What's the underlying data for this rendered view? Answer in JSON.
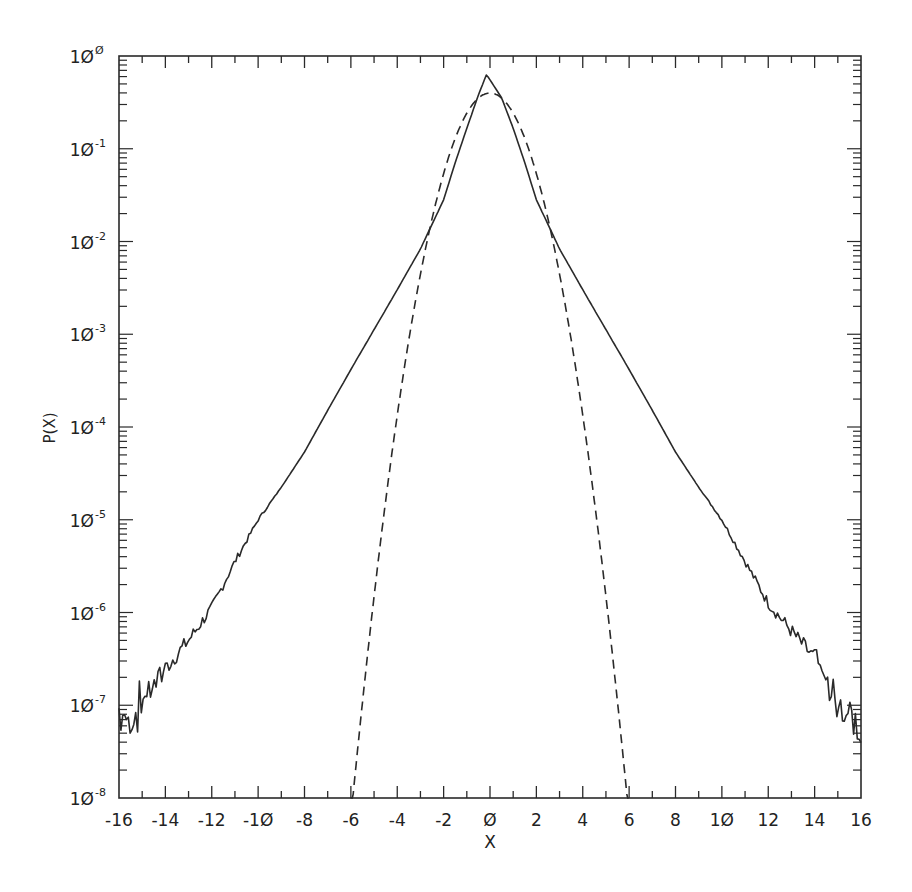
{
  "chart_data": {
    "type": "line",
    "title": "",
    "xlabel": "X",
    "ylabel": "P(X)",
    "xlim": [
      -16,
      16
    ],
    "ylim": [
      1e-08,
      1
    ],
    "yscale": "log",
    "grid": false,
    "legend": null,
    "x_ticks": [
      -16,
      -14,
      -12,
      -10,
      -8,
      -6,
      -4,
      -2,
      0,
      2,
      4,
      6,
      8,
      10,
      12,
      14,
      16
    ],
    "x_tick_labels": [
      "-16",
      "-14",
      "-12",
      "-1Ø",
      "-8",
      "-6",
      "-4",
      "-2",
      "Ø",
      "2",
      "4",
      "6",
      "8",
      "1Ø",
      "12",
      "14",
      "16"
    ],
    "y_tick_labels": [
      {
        "base": "1Ø",
        "exp": "Ø"
      },
      {
        "base": "1Ø",
        "exp": "-1"
      },
      {
        "base": "1Ø",
        "exp": "-2"
      },
      {
        "base": "1Ø",
        "exp": "-3"
      },
      {
        "base": "1Ø",
        "exp": "-4"
      },
      {
        "base": "1Ø",
        "exp": "-5"
      },
      {
        "base": "1Ø",
        "exp": "-6"
      },
      {
        "base": "1Ø",
        "exp": "-7"
      },
      {
        "base": "1Ø",
        "exp": "-8"
      }
    ],
    "series": [
      {
        "name": "empirical distribution",
        "style": "solid",
        "x": [
          -16,
          -15.5,
          -15,
          -14.5,
          -14,
          -13,
          -12,
          -11,
          -10,
          -9,
          -8,
          -7,
          -6,
          -5,
          -4,
          -3,
          -2,
          -1.5,
          -1,
          -0.5,
          -0.15,
          0.5,
          1,
          1.5,
          2,
          3,
          4,
          5,
          6,
          7,
          8,
          9,
          10,
          11,
          12,
          13,
          14,
          14.5,
          15,
          15.5,
          16
        ],
        "log10_values": [
          -7.05,
          -7.2,
          -6.95,
          -6.75,
          -6.6,
          -6.3,
          -5.95,
          -5.45,
          -5.0,
          -4.65,
          -4.27,
          -3.82,
          -3.38,
          -2.95,
          -2.52,
          -2.08,
          -1.55,
          -1.15,
          -0.78,
          -0.42,
          -0.2,
          -0.45,
          -0.78,
          -1.15,
          -1.55,
          -2.08,
          -2.52,
          -2.95,
          -3.38,
          -3.82,
          -4.27,
          -4.65,
          -5.0,
          -5.45,
          -5.9,
          -6.2,
          -6.5,
          -6.8,
          -6.95,
          -7.1,
          -7.3
        ],
        "values": [
          8.9e-08,
          6.3e-08,
          1.1e-07,
          1.8e-07,
          2.5e-07,
          5e-07,
          1.1e-06,
          3.5e-06,
          1e-05,
          2.2e-05,
          5.4e-05,
          0.00015,
          0.00042,
          0.0011,
          0.003,
          0.0083,
          0.028,
          0.071,
          0.17,
          0.38,
          0.63,
          0.35,
          0.17,
          0.071,
          0.028,
          0.0083,
          0.003,
          0.0011,
          0.00042,
          0.00015,
          5.4e-05,
          2.2e-05,
          1e-05,
          3.5e-06,
          1.3e-06,
          6.3e-07,
          3.2e-07,
          1.6e-07,
          1.1e-07,
          7.9e-08,
          5e-08
        ]
      },
      {
        "name": "Gaussian (sigma = 1)",
        "style": "dashed",
        "x": [
          -6,
          -5,
          -4,
          -3,
          -2,
          -1,
          0,
          1,
          2,
          3,
          4,
          5,
          6
        ],
        "values": [
          6.1e-09,
          1.5e-06,
          0.00013,
          0.0044,
          0.054,
          0.24,
          0.4,
          0.24,
          0.054,
          0.0044,
          0.00013,
          1.5e-06,
          6.1e-09
        ]
      }
    ]
  },
  "axes": {
    "xlabel": "X",
    "ylabel": "P(X)"
  }
}
